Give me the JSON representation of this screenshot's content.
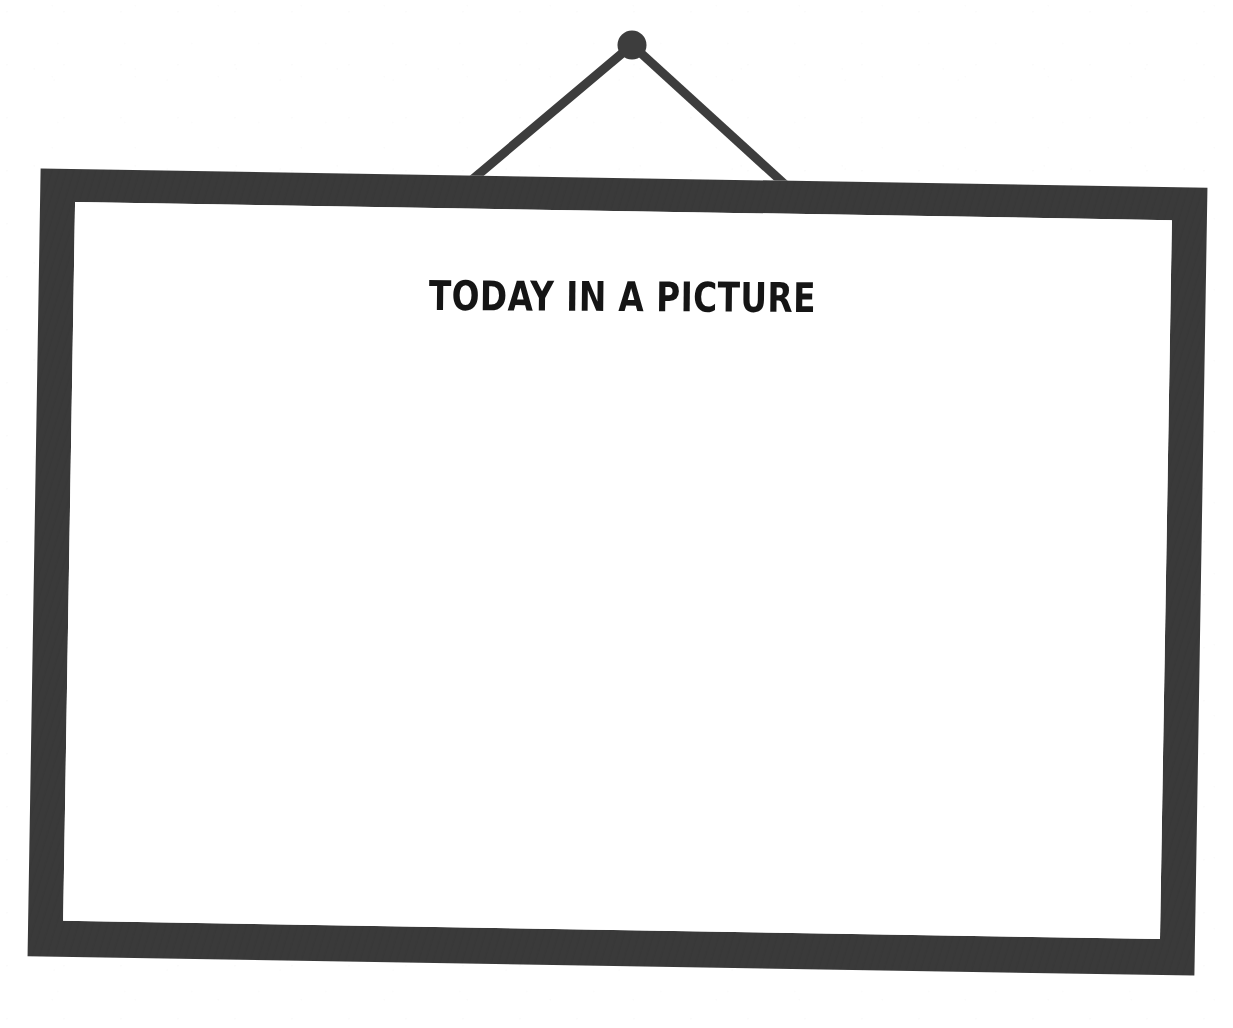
{
  "document": {
    "kind": "hanging-whiteboard-illustration",
    "background_color": "#ffffff"
  },
  "hanger": {
    "nail_label": "nail-knob",
    "cord_label": "hanging-cord",
    "color": "#3d3d3d",
    "nail": {
      "cx": 632,
      "cy": 45,
      "r": 14
    },
    "cords": [
      {
        "name": "left-cord",
        "x1": 632,
        "y1": 45,
        "x2": 448,
        "y2": 199
      },
      {
        "name": "right-cord",
        "x1": 632,
        "y1": 45,
        "x2": 812,
        "y2": 209
      }
    ]
  },
  "frame": {
    "color": "#3a3a3a",
    "border_thickness_px": 35,
    "rotation_deg": 0.95,
    "board_color": "#ffffff"
  },
  "board": {
    "heading": "TODAY IN A PICTURE",
    "heading_color": "#151515",
    "body": ""
  }
}
